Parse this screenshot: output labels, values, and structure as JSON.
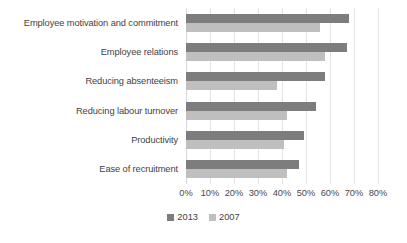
{
  "chart_data": {
    "type": "bar",
    "orientation": "horizontal",
    "title": "",
    "subtitle": "",
    "xlabel": "",
    "ylabel": "",
    "xlim": [
      0,
      80
    ],
    "grid": true,
    "legend_position": "bottom",
    "categories": [
      "Employee motivation and commitment",
      "Employee relations",
      "Reducing absenteeism",
      "Reducing labour turnover",
      "Productivity",
      "Ease of recruitment"
    ],
    "series": [
      {
        "name": "2013",
        "color": "#7d7d7d",
        "values": [
          68,
          67,
          58,
          54,
          49,
          47
        ]
      },
      {
        "name": "2007",
        "color": "#bfbfbf",
        "values": [
          56,
          58,
          38,
          42,
          41,
          42
        ]
      }
    ],
    "tick_labels": [
      "0%",
      "10%",
      "20%",
      "30%",
      "40%",
      "50%",
      "60%",
      "70%",
      "80%"
    ],
    "tick_values": [
      0,
      10,
      20,
      30,
      40,
      50,
      60,
      70,
      80
    ]
  },
  "legend": {
    "entries": [
      {
        "label": "2013"
      },
      {
        "label": "2007"
      }
    ]
  },
  "colors": {
    "series_2013": "#7d7d7d",
    "series_2007": "#bfbfbf",
    "gridline": "#e4e4e4",
    "text": "#3f3f3f",
    "background": "#ffffff"
  }
}
